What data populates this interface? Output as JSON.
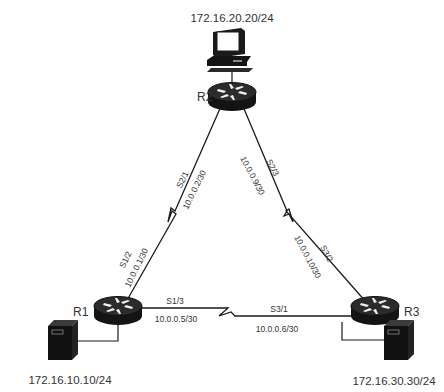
{
  "diagram": {
    "routers": [
      {
        "id": "R1",
        "label": "R1"
      },
      {
        "id": "R2",
        "label": "R2"
      },
      {
        "id": "R3",
        "label": "R3"
      }
    ],
    "hosts": [
      {
        "id": "pc",
        "type": "workstation",
        "ip": "172.16.20.20/24",
        "attached_to": "R2",
        "icon": "pc-icon"
      },
      {
        "id": "server1",
        "type": "server",
        "ip": "172.16.10.10/24",
        "attached_to": "R1",
        "icon": "server-icon"
      },
      {
        "id": "server3",
        "type": "server",
        "ip": "172.16.30.30/24",
        "attached_to": "R3",
        "icon": "server-icon"
      }
    ],
    "links": [
      {
        "id": "R1-R2",
        "type": "serial",
        "a": {
          "router": "R1",
          "interface": "S1/2",
          "ip": "10.0.0.1/30"
        },
        "b": {
          "router": "R2",
          "interface": "S2/1",
          "ip": "10.0.0.2/30"
        }
      },
      {
        "id": "R2-R3",
        "type": "serial",
        "a": {
          "router": "R2",
          "interface": "S2/3",
          "ip": "10.0.0.9/30"
        },
        "b": {
          "router": "R3",
          "interface": "S3/2",
          "ip": "10.0.0.10/30"
        }
      },
      {
        "id": "R1-R3",
        "type": "serial",
        "a": {
          "router": "R1",
          "interface": "S1/3",
          "ip": "10.0.0.5/30"
        },
        "b": {
          "router": "R3",
          "interface": "S3/1",
          "ip": "10.0.0.6/30"
        }
      }
    ]
  },
  "colors": {
    "line": "#1a1a1a",
    "device_dark": "#141414",
    "device_mid": "#3a3a3a",
    "text": "#333333"
  }
}
